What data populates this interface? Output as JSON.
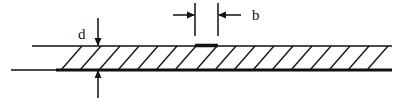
{
  "diagram": {
    "labels": {
      "thickness": "d",
      "width": "b"
    },
    "colors": {
      "line": "#111111",
      "background": "#ffffff"
    }
  }
}
